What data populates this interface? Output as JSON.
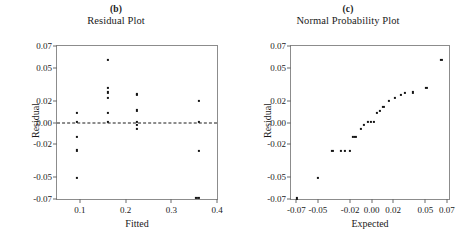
{
  "figure": {
    "panels": [
      {
        "tag": "(b)",
        "title": "Residual Plot",
        "xlabel": "Fitted",
        "ylabel": "Residual"
      },
      {
        "tag": "(c)",
        "title": "Normal Probability Plot",
        "xlabel": "Expected",
        "ylabel": "Residual"
      }
    ]
  },
  "chart_data": [
    {
      "type": "scatter",
      "title": "Residual Plot",
      "panel_tag": "(b)",
      "xlabel": "Fitted",
      "ylabel": "Residual",
      "xlim": [
        0.05,
        0.4
      ],
      "ylim": [
        -0.07,
        0.07
      ],
      "grid": false,
      "legend": "none",
      "xticks": [
        0.1,
        0.2,
        0.3,
        0.4
      ],
      "xtick_labels": [
        "0.1",
        "0.2",
        "0.3",
        "0.4"
      ],
      "yticks": [
        0.07,
        0.05,
        0.02,
        0.0,
        -0.02,
        -0.05,
        -0.07
      ],
      "ytick_labels": [
        "0.07",
        "0.05",
        "0.02",
        "0.00",
        "-0.02",
        "-0.05",
        "-0.07"
      ],
      "reference_line": {
        "type": "horizontal-dashed",
        "y": 0.0
      },
      "points": [
        {
          "x": 0.093,
          "y": 0.0085
        },
        {
          "x": 0.093,
          "y": 0.0005
        },
        {
          "x": 0.093,
          "y": -0.0135
        },
        {
          "x": 0.093,
          "y": -0.0255
        },
        {
          "x": 0.093,
          "y": -0.0505
        },
        {
          "x": 0.161,
          "y": 0.057
        },
        {
          "x": 0.161,
          "y": 0.032
        },
        {
          "x": 0.161,
          "y": 0.0275
        },
        {
          "x": 0.161,
          "y": 0.0225
        },
        {
          "x": 0.161,
          "y": 0.009
        },
        {
          "x": 0.161,
          "y": 0.0005
        },
        {
          "x": 0.225,
          "y": 0.0265
        },
        {
          "x": 0.225,
          "y": 0.025
        },
        {
          "x": 0.225,
          "y": 0.011
        },
        {
          "x": 0.225,
          "y": -0.002
        },
        {
          "x": 0.225,
          "y": -0.0055
        },
        {
          "x": 0.225,
          "y": 0.0005
        },
        {
          "x": 0.36,
          "y": 0.0195
        },
        {
          "x": 0.36,
          "y": 0.0005
        },
        {
          "x": 0.36,
          "y": -0.026
        },
        {
          "x": 0.36,
          "y": -0.069
        },
        {
          "x": 0.355,
          "y": -0.069
        }
      ]
    },
    {
      "type": "scatter",
      "title": "Normal Probability Plot",
      "panel_tag": "(c)",
      "xlabel": "Expected",
      "ylabel": "Residual",
      "xlim": [
        -0.075,
        0.072
      ],
      "ylim": [
        -0.07,
        0.07
      ],
      "grid": false,
      "legend": "none",
      "xticks": [
        -0.07,
        -0.05,
        -0.02,
        0.0,
        0.02,
        0.05,
        0.07
      ],
      "xtick_labels": [
        "-0.07",
        "-0.05",
        "-0.02",
        "0.00",
        "0.02",
        "0.05",
        "0.07"
      ],
      "yticks": [
        0.07,
        0.05,
        0.02,
        0.0,
        -0.02,
        -0.05,
        -0.07
      ],
      "ytick_labels": [
        "0.07",
        "0.05",
        "0.02",
        "0.00",
        "-0.02",
        "-0.05",
        "-0.07"
      ],
      "points": [
        {
          "x": -0.0695,
          "y": -0.0695
        },
        {
          "x": -0.05,
          "y": -0.0505
        },
        {
          "x": -0.0365,
          "y": -0.026
        },
        {
          "x": -0.0285,
          "y": -0.026
        },
        {
          "x": -0.0245,
          "y": -0.026
        },
        {
          "x": -0.0205,
          "y": -0.026
        },
        {
          "x": -0.0175,
          "y": -0.0135
        },
        {
          "x": -0.015,
          "y": -0.0135
        },
        {
          "x": -0.01,
          "y": -0.006
        },
        {
          "x": -0.007,
          "y": -0.002
        },
        {
          "x": -0.0035,
          "y": 0.0005
        },
        {
          "x": -0.001,
          "y": 0.0005
        },
        {
          "x": 0.002,
          "y": 0.0005
        },
        {
          "x": 0.005,
          "y": 0.0085
        },
        {
          "x": 0.0075,
          "y": 0.0105
        },
        {
          "x": 0.011,
          "y": 0.0145
        },
        {
          "x": 0.016,
          "y": 0.02
        },
        {
          "x": 0.0215,
          "y": 0.0225
        },
        {
          "x": 0.027,
          "y": 0.025
        },
        {
          "x": 0.031,
          "y": 0.027
        },
        {
          "x": 0.0385,
          "y": 0.0275
        },
        {
          "x": 0.051,
          "y": 0.032
        },
        {
          "x": 0.065,
          "y": 0.057
        }
      ]
    }
  ]
}
